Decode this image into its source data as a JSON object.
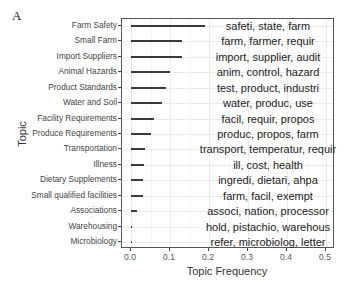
{
  "panel_label": "A",
  "chart_data": {
    "type": "bar",
    "orientation": "horizontal",
    "title": "",
    "xlabel": "Topic Frequency",
    "ylabel": "Topic",
    "xlim": [
      0.0,
      0.5
    ],
    "xticks": [
      "0.0",
      "0.1",
      "0.2",
      "0.3",
      "0.4",
      "0.5"
    ],
    "grid": true,
    "categories": [
      "Farm Safety",
      "Small Farm",
      "Import Suppliers",
      "Animal Hazards",
      "Product Standards",
      "Water and Soil",
      "Facility Requirements",
      "Produce Requirements",
      "Transportation",
      "Illness",
      "Dietary Supplements",
      "Small qualified facilities",
      "Associations",
      "Warehousing",
      "Microbiology"
    ],
    "values": [
      0.19,
      0.13,
      0.13,
      0.1,
      0.09,
      0.08,
      0.06,
      0.05,
      0.035,
      0.033,
      0.032,
      0.032,
      0.015,
      0.003,
      0.001
    ],
    "annotations": [
      "safeti, state, farm",
      "farm, farmer, requir",
      "import, supplier, audit",
      "anim, control, hazard",
      "test, product, industri",
      "water, produc, use",
      "facil, requir, propos",
      "produc, propos, farm",
      "transport, temperatur, requir",
      "ill, cost, health",
      "ingredi, dietari, ahpa",
      "farm, facil, exempt",
      "associ, nation, processor",
      "hold, pistachio, warehous",
      "refer, microbiolog, letter"
    ],
    "colors": {
      "bar": "#3a3a3a",
      "panel_border": "#555555",
      "grid": "#ebebeb"
    }
  }
}
